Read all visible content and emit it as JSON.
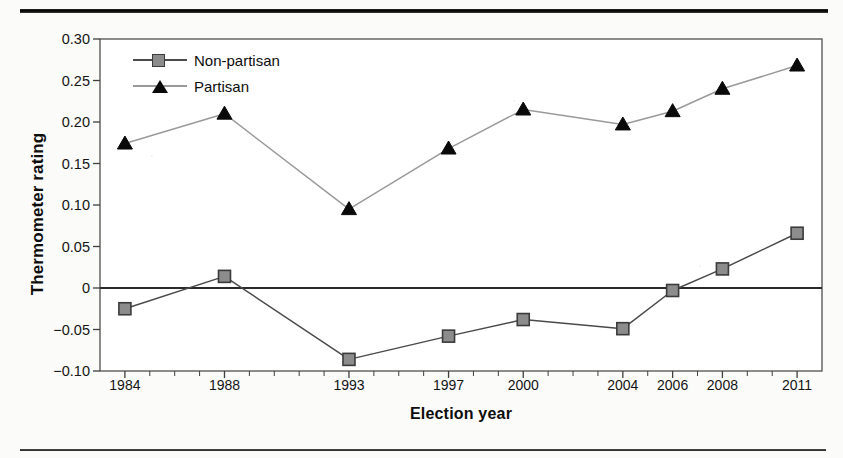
{
  "figure": {
    "background_color": "#fbfbf9",
    "rule_color": "#1a1a1a",
    "y_axis_title": "Thermometer rating",
    "x_axis_title": "Election year"
  },
  "chart_data": {
    "type": "line",
    "title": "",
    "xlabel": "Election year",
    "ylabel": "Thermometer rating",
    "x": [
      1984,
      1988,
      1993,
      1997,
      2000,
      2004,
      2006,
      2008,
      2011
    ],
    "categories": [
      "1984",
      "1988",
      "1993",
      "1997",
      "2000",
      "2004",
      "2006",
      "2008",
      "2011"
    ],
    "xlim": [
      1983,
      2012
    ],
    "ylim": [
      -0.1,
      0.3
    ],
    "yticks": [
      -0.1,
      -0.05,
      0,
      0.05,
      0.1,
      0.15,
      0.2,
      0.25,
      0.3
    ],
    "ytick_labels": [
      "−0.10",
      "−0.05",
      "0",
      "0.05",
      "0.10",
      "0.15",
      "0.20",
      "0.25",
      "0.30"
    ],
    "xtick_labels": [
      "1984",
      "1988",
      "1993",
      "1997",
      "2000",
      "2004",
      "2006",
      "2008",
      "2011"
    ],
    "grid": false,
    "legend_position": "top-left",
    "zero_line": 0,
    "series": [
      {
        "name": "Non-partisan",
        "marker": "square",
        "marker_color": "#8c8c8c",
        "marker_edge_color": "#3b3b3b",
        "line_color": "#4a4a4a",
        "values": [
          -0.025,
          0.014,
          -0.086,
          -0.058,
          -0.038,
          -0.049,
          -0.003,
          0.023,
          0.066
        ]
      },
      {
        "name": "Partisan",
        "marker": "triangle",
        "marker_color": "#0a0a0a",
        "marker_edge_color": "#0a0a0a",
        "line_color": "#9a9a9a",
        "values": [
          0.174,
          0.21,
          0.095,
          0.168,
          0.215,
          0.197,
          0.213,
          0.24,
          0.268
        ]
      }
    ]
  },
  "legend": {
    "items": [
      {
        "label": "Non-partisan",
        "marker": "square-marker",
        "line_color": "#4a4a4a"
      },
      {
        "label": "Partisan",
        "marker": "triangle-marker",
        "line_color": "#9a9a9a"
      }
    ]
  }
}
